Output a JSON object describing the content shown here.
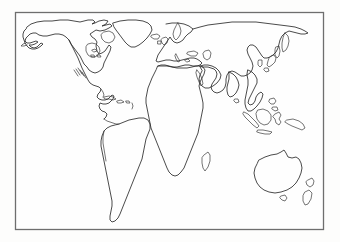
{
  "document": {
    "title": "World Outline Map",
    "type": "blank-world-map",
    "description": "Black and white outline map of the world showing continental coastlines without labels, enclosed in a thin rectangular border.",
    "background_color": "#fdfdfc",
    "stroke_color": "#2b2b2b",
    "frame_color": "#6e6e6e"
  },
  "frame": {
    "x": 15,
    "y": 12,
    "width": 309,
    "height": 218
  },
  "regions": [
    {
      "id": "north-america",
      "label": "North America"
    },
    {
      "id": "greenland",
      "label": "Greenland"
    },
    {
      "id": "canadian-arctic-islands",
      "label": "Canadian Arctic Islands"
    },
    {
      "id": "central-america",
      "label": "Central America"
    },
    {
      "id": "caribbean-islands",
      "label": "Caribbean Islands"
    },
    {
      "id": "south-america",
      "label": "South America"
    },
    {
      "id": "europe",
      "label": "Europe"
    },
    {
      "id": "british-isles",
      "label": "British Isles"
    },
    {
      "id": "iceland",
      "label": "Iceland"
    },
    {
      "id": "africa",
      "label": "Africa"
    },
    {
      "id": "madagascar",
      "label": "Madagascar"
    },
    {
      "id": "arabian-peninsula",
      "label": "Arabian Peninsula"
    },
    {
      "id": "asia",
      "label": "Asia"
    },
    {
      "id": "india",
      "label": "Indian Subcontinent"
    },
    {
      "id": "japan",
      "label": "Japan"
    },
    {
      "id": "indonesia",
      "label": "Indonesian Archipelago"
    },
    {
      "id": "philippines",
      "label": "Philippines"
    },
    {
      "id": "new-guinea",
      "label": "New Guinea"
    },
    {
      "id": "australia",
      "label": "Australia"
    },
    {
      "id": "tasmania",
      "label": "Tasmania"
    },
    {
      "id": "new-zealand",
      "label": "New Zealand"
    },
    {
      "id": "sri-lanka",
      "label": "Sri Lanka"
    }
  ],
  "labels": {
    "visible_text": "",
    "note": "No text labels are printed on the map."
  }
}
